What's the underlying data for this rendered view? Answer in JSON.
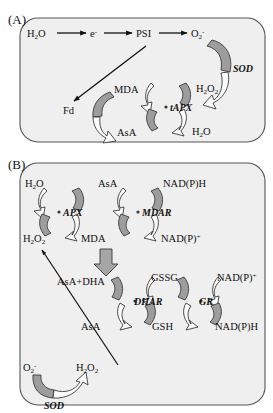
{
  "figure": {
    "panels": [
      {
        "id": "A",
        "label": "(A)"
      },
      {
        "id": "B",
        "label": "(B)"
      }
    ]
  },
  "colors": {
    "panel_fill": "#efefef",
    "panel_stroke": "#555555",
    "ribbon_gray": "#9d9d9d",
    "ribbon_white": "#fdfdfd",
    "ribbon_stroke": "#3a3a3a",
    "arrow_black": "#111111",
    "block_arrow_gray": "#a6a6a6",
    "text": "#111111",
    "background": "#ffffff"
  },
  "panelA": {
    "label": "(A)",
    "chain": {
      "nodes": [
        "H",
        "2",
        "O",
        "e",
        "-",
        "PSI",
        "O",
        "2",
        "-"
      ],
      "items": [
        {
          "name": "water",
          "base": "H",
          "sub": "2",
          "tail": "O"
        },
        {
          "name": "electron",
          "base": "e",
          "sup": "-"
        },
        {
          "name": "photosystem-one",
          "base": "PSI"
        },
        {
          "name": "superoxide",
          "base": "O",
          "sub": "2",
          "sup": "-"
        }
      ]
    },
    "enzymes": [
      {
        "name": "sod",
        "label": "SOD"
      },
      {
        "name": "tapx",
        "label": "tAPX"
      }
    ],
    "metabolites": [
      {
        "name": "ferredoxin",
        "label": "Fd"
      },
      {
        "name": "monodehydroascorbate",
        "label": "MDA"
      },
      {
        "name": "ascorbate",
        "label": "AsA"
      },
      {
        "name": "hydrogen-peroxide",
        "base": "H",
        "sub": "2",
        "mid": "O",
        "sub2": "2"
      },
      {
        "name": "water-product",
        "base": "H",
        "sub": "2",
        "tail": "O"
      }
    ]
  },
  "panelB": {
    "label": "(B)",
    "enzymes": [
      {
        "name": "apx",
        "label": "APX"
      },
      {
        "name": "mdar",
        "label": "MDAR"
      },
      {
        "name": "dhar",
        "label": "DHAR"
      },
      {
        "name": "gr",
        "label": "GR"
      },
      {
        "name": "sod",
        "label": "SOD"
      }
    ],
    "metabolites": [
      {
        "name": "water-top-left",
        "label": "H2O"
      },
      {
        "name": "ascorbate-top",
        "label": "AsA"
      },
      {
        "name": "nadph-top",
        "label": "NAD(P)H"
      },
      {
        "name": "hydrogen-peroxide-left",
        "label": "H2O2"
      },
      {
        "name": "mda",
        "label": "MDA"
      },
      {
        "name": "nadp-plus",
        "label": "NAD(P)+"
      },
      {
        "name": "asa-plus-dha",
        "label": "AsA+DHA"
      },
      {
        "name": "gssg",
        "label": "GSSG"
      },
      {
        "name": "nadp-plus-right",
        "label": "NAD(P)+"
      },
      {
        "name": "ascorbate-lower",
        "label": "AsA"
      },
      {
        "name": "gsh",
        "label": "GSH"
      },
      {
        "name": "nadph-lower-right",
        "label": "NAD(P)H"
      },
      {
        "name": "superoxide-bottom",
        "label": "O2-"
      },
      {
        "name": "hydrogen-peroxide-bottom",
        "label": "H2O2"
      }
    ]
  }
}
